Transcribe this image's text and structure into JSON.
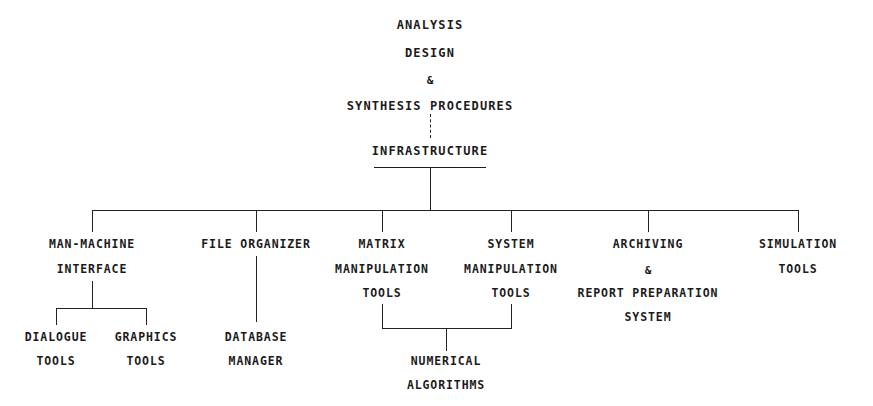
{
  "diagram": {
    "title_block": {
      "line1": "ANALYSIS",
      "line2": "DESIGN",
      "line3": "&",
      "line4": "SYNTHESIS PROCEDURES"
    },
    "root": {
      "label": "INFRASTRUCTURE"
    },
    "branches": [
      {
        "id": "man-machine-interface",
        "lines": [
          "MAN-MACHINE",
          "INTERFACE"
        ],
        "children": [
          {
            "id": "dialogue-tools",
            "lines": [
              "DIALOGUE",
              "TOOLS"
            ]
          },
          {
            "id": "graphics-tools",
            "lines": [
              "GRAPHICS",
              "TOOLS"
            ]
          }
        ]
      },
      {
        "id": "file-organizer",
        "lines": [
          "FILE ORGANIZER"
        ],
        "children": [
          {
            "id": "database-manager",
            "lines": [
              "DATABASE",
              "MANAGER"
            ]
          }
        ]
      },
      {
        "id": "matrix-manipulation-tools",
        "lines": [
          "MATRIX",
          "MANIPULATION",
          "TOOLS"
        ],
        "children": []
      },
      {
        "id": "system-manipulation-tools",
        "lines": [
          "SYSTEM",
          "MANIPULATION",
          "TOOLS"
        ],
        "children": []
      },
      {
        "id": "archiving-report-preparation-system",
        "lines": [
          "ARCHIVING",
          "&",
          "REPORT PREPARATION",
          "SYSTEM"
        ],
        "children": []
      },
      {
        "id": "simulation-tools",
        "lines": [
          "SIMULATION",
          "TOOLS"
        ],
        "children": []
      }
    ],
    "shared_child": {
      "id": "numerical-algorithms",
      "lines": [
        "NUMERICAL",
        "ALGORITHMS"
      ],
      "parents": [
        "matrix-manipulation-tools",
        "system-manipulation-tools"
      ]
    },
    "colors": {
      "ink": "#1b1b1b",
      "line": "#222222",
      "background": "#ffffff"
    },
    "connector_styles": {
      "title_to_root": "dashed",
      "root_to_branches": "solid",
      "branch_to_children": "solid"
    }
  }
}
